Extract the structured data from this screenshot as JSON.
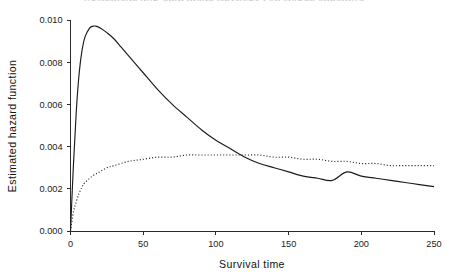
{
  "page": {
    "running_header": "NUMERICAL AND GRAPHICAL METHODS FOR MODEL CHECKING"
  },
  "chart_data": {
    "type": "line",
    "title": "",
    "xlabel": "Survival time",
    "ylabel": "Estimated hazard function",
    "xlim": [
      0,
      250
    ],
    "ylim": [
      0.0,
      0.01
    ],
    "xticks": [
      0,
      50,
      100,
      150,
      200,
      250
    ],
    "xtick_labels": [
      "0",
      "50",
      "100",
      "150",
      "200",
      "250"
    ],
    "yticks": [
      0.0,
      0.002,
      0.004,
      0.006,
      0.008,
      0.01
    ],
    "ytick_labels": [
      "0.000",
      "0.002",
      "0.004",
      "0.006",
      "0.008",
      "0.010"
    ],
    "grid": false,
    "legend": null,
    "annotations": [
      "Solid curve peaks at about 0.0097 near survival time 15",
      "Dotted curve plateaus near 0.0036 between survival time 100 and 130",
      "The two curves cross at about survival time 187 at roughly 0.0028"
    ],
    "series": [
      {
        "name": "hazard-solid",
        "style": "solid",
        "x": [
          0,
          2,
          4,
          6,
          8,
          10,
          13,
          15,
          18,
          21,
          25,
          30,
          35,
          40,
          45,
          50,
          60,
          70,
          80,
          90,
          100,
          110,
          120,
          130,
          140,
          150,
          160,
          170,
          180,
          190,
          200,
          210,
          220,
          230,
          240,
          250
        ],
        "y": [
          0.0,
          0.0031,
          0.0057,
          0.0075,
          0.0086,
          0.0092,
          0.0096,
          0.0097,
          0.0097,
          0.0096,
          0.0094,
          0.0091,
          0.0087,
          0.0083,
          0.0079,
          0.0075,
          0.0067,
          0.006,
          0.0054,
          0.0048,
          0.0043,
          0.0039,
          0.0035,
          0.0032,
          0.003,
          0.0028,
          0.0026,
          0.0025,
          0.0024,
          0.0028,
          0.0026,
          0.0025,
          0.0024,
          0.0023,
          0.0022,
          0.0021
        ]
      },
      {
        "name": "hazard-dotted",
        "style": "dotted",
        "x": [
          0,
          2,
          4,
          6,
          8,
          10,
          15,
          20,
          25,
          30,
          40,
          50,
          60,
          70,
          80,
          90,
          100,
          110,
          120,
          130,
          140,
          150,
          160,
          170,
          180,
          190,
          200,
          210,
          220,
          230,
          240,
          250
        ],
        "y": [
          0.0,
          0.0009,
          0.0014,
          0.0018,
          0.0021,
          0.0023,
          0.0026,
          0.0028,
          0.003,
          0.0031,
          0.0033,
          0.0034,
          0.0035,
          0.0035,
          0.0036,
          0.0036,
          0.0036,
          0.0036,
          0.0036,
          0.0036,
          0.0035,
          0.0035,
          0.0034,
          0.0034,
          0.0033,
          0.0033,
          0.0032,
          0.0032,
          0.0031,
          0.0031,
          0.0031,
          0.0031
        ]
      }
    ]
  }
}
